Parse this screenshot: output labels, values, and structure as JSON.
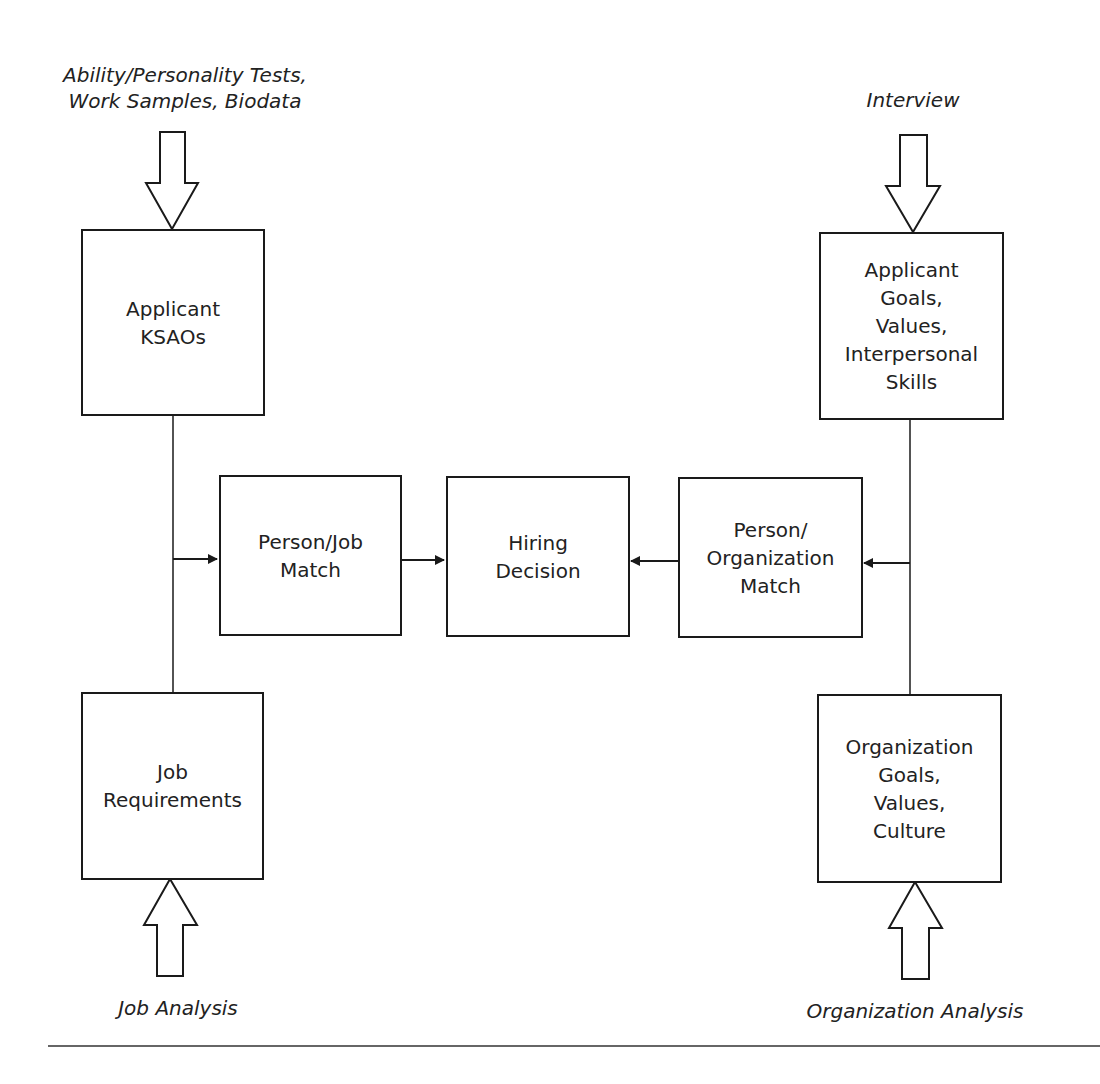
{
  "diagram": {
    "inputs": {
      "top_left": "Ability/Personality Tests,\nWork Samples, Biodata",
      "top_right": "Interview",
      "bottom_left": "Job Analysis",
      "bottom_right": "Organization Analysis"
    },
    "boxes": {
      "applicant_ksaos": "Applicant\nKSAOs",
      "job_requirements": "Job\nRequirements",
      "person_job_match": "Person/Job\nMatch",
      "hiring_decision": "Hiring\nDecision",
      "person_org_match": "Person/\nOrganization\nMatch",
      "applicant_goals": "Applicant\nGoals,\nValues,\nInterpersonal\nSkills",
      "org_goals": "Organization\nGoals,\nValues,\nCulture"
    },
    "edges": [
      {
        "from": "top_left",
        "to": "applicant_ksaos",
        "type": "block-arrow"
      },
      {
        "from": "bottom_left",
        "to": "job_requirements",
        "type": "block-arrow"
      },
      {
        "from": "top_right",
        "to": "applicant_goals",
        "type": "block-arrow"
      },
      {
        "from": "bottom_right",
        "to": "org_goals",
        "type": "block-arrow"
      },
      {
        "from": "applicant_ksaos+job_requirements",
        "to": "person_job_match",
        "type": "arrow"
      },
      {
        "from": "applicant_goals+org_goals",
        "to": "person_org_match",
        "type": "arrow"
      },
      {
        "from": "person_job_match",
        "to": "hiring_decision",
        "type": "arrow"
      },
      {
        "from": "person_org_match",
        "to": "hiring_decision",
        "type": "arrow"
      }
    ]
  }
}
